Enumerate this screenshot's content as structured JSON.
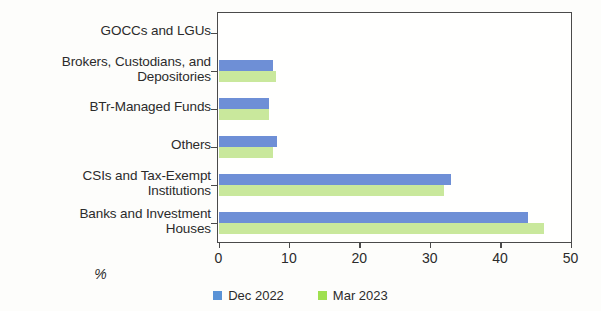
{
  "chart_data": {
    "type": "bar",
    "orientation": "horizontal",
    "title": "",
    "xlabel": "%",
    "ylabel": "",
    "xlim": [
      0,
      50
    ],
    "xticks": [
      0,
      10,
      20,
      30,
      40,
      50
    ],
    "xtick_labels": [
      "0",
      "10",
      "20",
      "30",
      "40",
      "50"
    ],
    "grid": false,
    "legend_position": "bottom",
    "categories": [
      "GOCCs and LGUs",
      "Brokers, Custodians, and\nDepositories",
      "BTr-Managed Funds",
      "Others",
      "CSIs and Tax-Exempt\nInstitutions",
      "Banks and Investment\nHouses"
    ],
    "series": [
      {
        "name": "Dec 2022",
        "color": "#6e8fd6",
        "values": [
          0.0,
          7.8,
          7.2,
          8.3,
          33.0,
          44.0
        ]
      },
      {
        "name": "Mar 2023",
        "color": "#c9e89c",
        "values": [
          0.0,
          8.2,
          7.2,
          7.8,
          32.0,
          46.3
        ]
      }
    ]
  },
  "legend": {
    "items": [
      {
        "label": "Dec 2022"
      },
      {
        "label": "Mar 2023"
      }
    ]
  }
}
